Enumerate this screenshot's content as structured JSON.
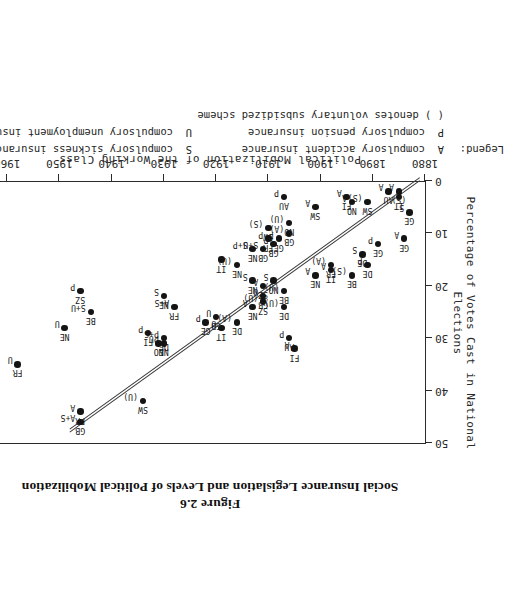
{
  "figure": {
    "number": "Figure 2.6",
    "title": "Social Insurance Legislation and Levels of Political Mobilization"
  },
  "axes": {
    "x_title": "",
    "y_title": "Percentage of Votes Cast in National Elections",
    "bottom_title": "Political Mobilization of the Working Class",
    "x_ticks": [
      "1880",
      "1890",
      "1900",
      "1910",
      "1920",
      "1930",
      "1940",
      "1950",
      "1960",
      "1970"
    ],
    "y_ticks": [
      "0",
      "10",
      "20",
      "30",
      "40",
      "50"
    ]
  },
  "legend": {
    "head": "Legend:",
    "a_key": "A",
    "a_text": "compulsory accident insurance",
    "s_key": "S",
    "s_text": "compulsory sickness insurance",
    "p_key": "P",
    "p_text": "compulsory pension insurance",
    "u_key": "U",
    "u_text": "compulsory unemployment insurance",
    "note": "( ) denotes voluntary subsidized scheme"
  },
  "chart_data": {
    "type": "scatter",
    "title": "Social Insurance Legislation and Levels of Political Mobilization",
    "xlabel": "Political Mobilization of the Working Class",
    "ylabel": "Percentage of Votes Cast in National Elections",
    "xlim": [
      1880,
      1970
    ],
    "ylim": [
      0,
      50
    ],
    "grid": false,
    "legend_position": "below-plot",
    "points": [
      {
        "country": "GE",
        "program": "A",
        "x": 1884,
        "y": 11
      },
      {
        "country": "GE",
        "program": "S",
        "x": 1883,
        "y": 6
      },
      {
        "country": "AU",
        "program": "A",
        "x": 1887,
        "y": 2
      },
      {
        "country": "(S)",
        "program": "A",
        "x": 1885,
        "y": 2
      },
      {
        "country": "IT",
        "program": "",
        "x": 1885,
        "y": 3
      },
      {
        "country": "GE",
        "program": "P",
        "x": 1889,
        "y": 12
      },
      {
        "country": "DE",
        "program": "S",
        "x": 1892,
        "y": 14
      },
      {
        "country": "DE",
        "program": "P",
        "x": 1891,
        "y": 16
      },
      {
        "country": "BE",
        "program": "(S)",
        "x": 1894,
        "y": 18
      },
      {
        "country": "SW",
        "program": "(S)",
        "x": 1891,
        "y": 4
      },
      {
        "country": "NO",
        "program": "A",
        "x": 1894,
        "y": 4
      },
      {
        "country": "FI",
        "program": "A",
        "x": 1895,
        "y": 3
      },
      {
        "country": "FR",
        "program": "(A)",
        "x": 1898,
        "y": 16
      },
      {
        "country": "IT",
        "program": "A",
        "x": 1898,
        "y": 17
      },
      {
        "country": "NE",
        "program": "A",
        "x": 1901,
        "y": 18
      },
      {
        "country": "SW",
        "program": "A",
        "x": 1901,
        "y": 5
      },
      {
        "country": "GB",
        "program": "(A)",
        "x": 1906,
        "y": 10
      },
      {
        "country": "GE",
        "program": "P",
        "x": 1908,
        "y": 11
      },
      {
        "country": "AU",
        "program": "P",
        "x": 1907,
        "y": 3
      },
      {
        "country": "GB",
        "program": "S+U",
        "x": 1911,
        "y": 13
      },
      {
        "country": "GB",
        "program": "P",
        "x": 1909,
        "y": 12
      },
      {
        "country": "NE",
        "program": "S",
        "x": 1913,
        "y": 19
      },
      {
        "country": "SZ",
        "program": "(U)",
        "x": 1911,
        "y": 23
      },
      {
        "country": "NE",
        "program": "A",
        "x": 1913,
        "y": 24
      },
      {
        "country": "GB",
        "program": "U",
        "x": 1911,
        "y": 22
      },
      {
        "country": "NO",
        "program": "(U)",
        "x": 1906,
        "y": 8
      },
      {
        "country": "SW",
        "program": "(S)",
        "x": 1910,
        "y": 9
      },
      {
        "country": "FR",
        "program": "P",
        "x": 1910,
        "y": 11
      },
      {
        "country": "NE",
        "program": "S+P",
        "x": 1913,
        "y": 13
      },
      {
        "country": "IT",
        "program": "",
        "x": 1919,
        "y": 15
      },
      {
        "country": "NE",
        "program": "(U)",
        "x": 1916,
        "y": 16
      },
      {
        "country": "BE",
        "program": "(U)",
        "x": 1907,
        "y": 21
      },
      {
        "country": "NO",
        "program": "S",
        "x": 1909,
        "y": 19
      },
      {
        "country": "SZ",
        "program": "A",
        "x": 1911,
        "y": 20
      },
      {
        "country": "DE",
        "program": "(U)",
        "x": 1907,
        "y": 24
      },
      {
        "country": "DE",
        "program": "(A)",
        "x": 1916,
        "y": 27
      },
      {
        "country": "AU",
        "program": "P",
        "x": 1906,
        "y": 30
      },
      {
        "country": "FI",
        "program": "A",
        "x": 1905,
        "y": 32
      },
      {
        "country": "IT",
        "program": "U",
        "x": 1919,
        "y": 28
      },
      {
        "country": "GE",
        "program": "P",
        "x": 1922,
        "y": 27
      },
      {
        "country": "GB",
        "program": "U",
        "x": 1920,
        "y": 26
      },
      {
        "country": "FR",
        "program": "A+S",
        "x": 1928,
        "y": 24
      },
      {
        "country": "DE",
        "program": "P+S",
        "x": 1930,
        "y": 30
      },
      {
        "country": "NE",
        "program": "P",
        "x": 1930,
        "y": 31
      },
      {
        "country": "NO",
        "program": "U",
        "x": 1931,
        "y": 31
      },
      {
        "country": "FI",
        "program": "P",
        "x": 1933,
        "y": 29
      },
      {
        "country": "SW",
        "program": "(U)",
        "x": 1934,
        "y": 42
      },
      {
        "country": "NE",
        "program": "S",
        "x": 1930,
        "y": 22
      },
      {
        "country": "BE",
        "program": "S+U",
        "x": 1944,
        "y": 25
      },
      {
        "country": "SZ",
        "program": "P",
        "x": 1946,
        "y": 21
      },
      {
        "country": "NE",
        "program": "U",
        "x": 1949,
        "y": 28
      },
      {
        "country": "GB",
        "program": "A+S",
        "x": 1946,
        "y": 46
      },
      {
        "country": "FR",
        "program": "A",
        "x": 1946,
        "y": 44
      },
      {
        "country": "FR",
        "program": "U",
        "x": 1958,
        "y": 35
      },
      {
        "country": "FI",
        "program": "S",
        "x": 1963,
        "y": 44
      },
      {
        "country": "FR",
        "program": "U",
        "x": 1967,
        "y": 43
      }
    ]
  }
}
